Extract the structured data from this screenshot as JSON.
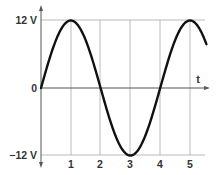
{
  "chart_data": {
    "type": "line",
    "title": "",
    "xlabel": "t",
    "ylabel": "",
    "x_ticks": [
      "1",
      "2",
      "3",
      "4",
      "5"
    ],
    "y_ticks": [
      "12 V",
      "0",
      "−12 V"
    ],
    "xlim": [
      0,
      5.55
    ],
    "ylim": [
      -12,
      12
    ],
    "grid": true,
    "legend": null,
    "series": [
      {
        "name": "sinusoidal voltage",
        "function": "12*sin(pi*t/2)",
        "x": [
          0,
          0.5,
          1,
          1.5,
          2,
          2.5,
          3,
          3.5,
          4,
          4.5,
          5,
          5.5
        ],
        "values": [
          0,
          8.49,
          12,
          8.49,
          0,
          -8.49,
          -12,
          -8.49,
          0,
          8.49,
          12,
          8.49
        ]
      }
    ],
    "amplitude": 12,
    "period": 4,
    "colors": {
      "curve": "#111111",
      "grid": "#a0a0a0",
      "axis": "#555555",
      "text": "#333333"
    }
  },
  "labels": {
    "y_top": "12 V",
    "y_zero": "0",
    "y_bottom": "−12 V",
    "x_axis": "t",
    "x1": "1",
    "x2": "2",
    "x3": "3",
    "x4": "4",
    "x5": "5"
  }
}
